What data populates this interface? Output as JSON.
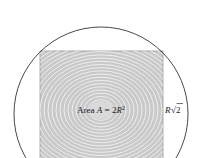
{
  "diagram": {
    "area_label": {
      "prefix": "Area ",
      "var": "A",
      "eq": " = 2",
      "var2": "R",
      "exp": "2"
    },
    "side_label": {
      "var": "R",
      "radical": "√",
      "radicand": "2"
    },
    "colors": {
      "circle_stroke": "#333333",
      "square_fill": "#c8c8c8",
      "ring_stroke": "#a8a8a8",
      "square_stroke": "#9a9a9a"
    }
  }
}
